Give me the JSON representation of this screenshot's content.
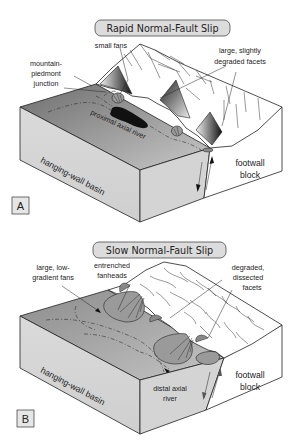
{
  "figure": {
    "panels": [
      {
        "letter": "A",
        "title": "Rapid Normal-Fault Slip",
        "labels": {
          "small_fans": "small fans",
          "mountain_piedmont_line1": "mountain-",
          "mountain_piedmont_line2": "piedmont",
          "mountain_piedmont_line3": "junction",
          "facets_line1": "large, slightly",
          "facets_line2": "degraded facets",
          "axial_river": "proximal axial river",
          "footwall_line1": "footwall",
          "footwall_line2": "block",
          "basin": "hanging-wall basin"
        }
      },
      {
        "letter": "B",
        "title": "Slow Normal-Fault Slip",
        "labels": {
          "fans_line1": "large, low-",
          "fans_line2": "gradient fans",
          "fanheads_line1": "entrenched",
          "fanheads_line2": "fanheads",
          "facets_line1": "degraded,",
          "facets_line2": "dissected",
          "facets_line3": "facets",
          "axial_river_line1": "distal axial",
          "axial_river_line2": "river",
          "footwall_line1": "footwall",
          "footwall_line2": "block",
          "basin": "hanging-wall basin"
        }
      }
    ],
    "colors": {
      "basin_top": "#8a8a8a",
      "basin_side": "#d6d6d6",
      "footwall_side": "#ffffff",
      "title_box": "#dcdcdc",
      "fan": "#9a9a9a",
      "river": "#111111"
    }
  }
}
